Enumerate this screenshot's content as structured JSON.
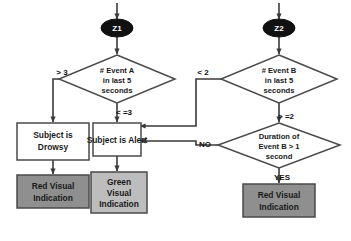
{
  "diagram": {
    "colors": {
      "red_indication_fill": "#8f8f8f",
      "green_indication_fill": "#bdbdbd",
      "terminator_fill": "#111111",
      "line": "#4a4a4a"
    },
    "terminators": [
      {
        "id": "z1",
        "label": "Z1"
      },
      {
        "id": "z2",
        "label": "Z2"
      }
    ],
    "decisions": [
      {
        "id": "event-a",
        "lines": [
          "#  Event A",
          "in last 5",
          "seconds"
        ]
      },
      {
        "id": "event-b",
        "lines": [
          "#  Event B",
          "in last 5",
          "seconds"
        ]
      },
      {
        "id": "duration-b",
        "lines": [
          "Duration of",
          "Event B > 1",
          "second"
        ]
      }
    ],
    "states": [
      {
        "id": "drowsy",
        "lines": [
          "Subject is",
          "Drowsy"
        ]
      },
      {
        "id": "alert",
        "lines": [
          "Subject is Alert"
        ]
      }
    ],
    "indications": [
      {
        "id": "red-left",
        "lines": [
          "Red Visual",
          "Indication"
        ]
      },
      {
        "id": "green",
        "lines": [
          "Green",
          "Visual",
          "Indication"
        ]
      },
      {
        "id": "red-right",
        "lines": [
          "Red Visual",
          "Indication"
        ]
      }
    ],
    "edge_labels": [
      {
        "id": "gt3",
        "text": "> 3"
      },
      {
        "id": "lte3",
        "text": "< =3"
      },
      {
        "id": "lt2",
        "text": "< 2"
      },
      {
        "id": "gte2",
        "text": "> =2"
      },
      {
        "id": "no",
        "text": "NO"
      },
      {
        "id": "yes",
        "text": "YES"
      }
    ]
  }
}
